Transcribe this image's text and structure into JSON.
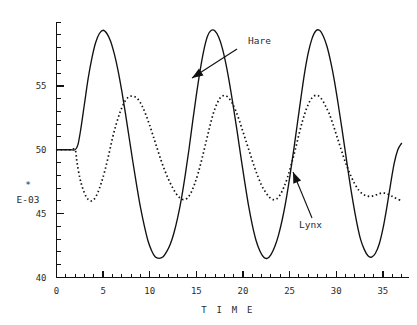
{
  "chart_data": {
    "type": "line",
    "title": "",
    "xlabel": "T I M E",
    "ylabel": "",
    "scale_note_marker": "*",
    "scale_note": "E-03",
    "xlim": [
      0,
      37.8
    ],
    "ylim": [
      40,
      60
    ],
    "grid": false,
    "legend_position": "inline-annotations",
    "x_ticks_major": [
      0,
      5,
      10,
      15,
      20,
      25,
      30,
      35
    ],
    "x_tick_labels": [
      "0",
      "5",
      "10",
      "15",
      "20",
      "25",
      "30",
      "35"
    ],
    "x_tick_minor_step": 1,
    "y_ticks_major": [
      40,
      45,
      50,
      55
    ],
    "y_tick_labels": [
      "40",
      "45",
      "50",
      "55"
    ],
    "y_tick_minor_step": 1,
    "annotations": [
      {
        "label": "Hare",
        "series": "Hare",
        "text_x": 248,
        "text_y": 44,
        "arrow_from_x": 237,
        "arrow_from_y": 49,
        "arrow_to_x": 192,
        "arrow_to_y": 78
      },
      {
        "label": "Lynx",
        "series": "Lynx",
        "text_x": 299,
        "text_y": 228,
        "arrow_from_x": 312,
        "arrow_from_y": 218,
        "arrow_to_x": 293,
        "arrow_to_y": 172
      }
    ],
    "series": [
      {
        "name": "Hare",
        "style": "solid",
        "x": [
          0,
          0.5,
          1,
          1.5,
          2,
          2.3,
          2.6,
          3,
          3.4,
          3.8,
          4.2,
          4.6,
          5,
          5.4,
          5.8,
          6.2,
          6.6,
          7,
          7.4,
          7.8,
          8.2,
          8.6,
          9,
          9.4,
          9.8,
          10.2,
          10.6,
          11,
          11.4,
          11.8,
          12.2,
          12.6,
          13,
          13.4,
          13.8,
          14.2,
          14.6,
          15,
          15.4,
          15.8,
          16.2,
          16.6,
          17,
          17.4,
          17.8,
          18.2,
          18.6,
          19,
          19.4,
          19.8,
          20.2,
          20.6,
          21,
          21.4,
          21.8,
          22.2,
          22.6,
          23,
          23.4,
          23.8,
          24.2,
          24.6,
          25,
          25.4,
          25.8,
          26.2,
          26.6,
          27,
          27.4,
          27.8,
          28.2,
          28.6,
          29,
          29.4,
          29.8,
          30.2,
          30.6,
          31,
          31.4,
          31.8,
          32.2,
          32.6,
          33,
          33.4,
          33.8,
          34.2,
          34.6,
          35,
          35.4,
          35.8,
          36.2,
          36.6,
          37
        ],
        "y": [
          50,
          50,
          50,
          50,
          50,
          50.4,
          51.6,
          53.6,
          55.6,
          57.2,
          58.4,
          59.1,
          59.35,
          59.1,
          58.5,
          57.5,
          56.2,
          54.6,
          52.8,
          50.9,
          49.0,
          47.2,
          45.5,
          44.1,
          42.9,
          42.1,
          41.6,
          41.5,
          41.6,
          42.0,
          42.6,
          43.5,
          44.7,
          46.2,
          48.0,
          50.0,
          52.2,
          54.3,
          56.2,
          57.8,
          58.9,
          59.35,
          59.3,
          58.8,
          57.9,
          56.6,
          55.0,
          53.2,
          51.3,
          49.3,
          47.4,
          45.6,
          44.1,
          42.9,
          42.1,
          41.6,
          41.5,
          41.8,
          42.4,
          43.3,
          44.5,
          46.0,
          47.8,
          49.8,
          51.9,
          54.0,
          56.0,
          57.6,
          58.7,
          59.3,
          59.35,
          58.9,
          58.1,
          56.9,
          55.4,
          53.6,
          51.7,
          49.7,
          47.7,
          45.9,
          44.3,
          43.0,
          42.2,
          41.7,
          41.6,
          41.9,
          42.6,
          43.8,
          45.4,
          47.2,
          48.9,
          50.0,
          50.5
        ]
      },
      {
        "name": "Lynx",
        "style": "dotted",
        "x": [
          0,
          0.5,
          1,
          1.5,
          2,
          2.2,
          2.5,
          2.8,
          3.2,
          3.6,
          4,
          4.4,
          4.8,
          5.2,
          5.6,
          6,
          6.4,
          6.8,
          7.2,
          7.6,
          8,
          8.4,
          8.8,
          9.2,
          9.6,
          10,
          10.4,
          10.8,
          11.2,
          11.6,
          12,
          12.4,
          12.8,
          13.2,
          13.6,
          14,
          14.4,
          14.8,
          15.2,
          15.6,
          16,
          16.4,
          16.8,
          17.2,
          17.6,
          18,
          18.4,
          18.8,
          19.2,
          19.6,
          20,
          20.4,
          20.8,
          21.2,
          21.6,
          22,
          22.4,
          22.8,
          23.2,
          23.6,
          24,
          24.4,
          24.8,
          25.2,
          25.6,
          26,
          26.4,
          26.8,
          27.2,
          27.6,
          28,
          28.4,
          28.8,
          29.2,
          29.6,
          30,
          30.4,
          30.8,
          31.2,
          31.6,
          32,
          32.4,
          32.8,
          33.2,
          33.6,
          34,
          34.4,
          34.8,
          35.2,
          35.6,
          36,
          36.4,
          37
        ],
        "y": [
          50,
          50,
          50,
          50,
          50,
          49.0,
          47.8,
          47.0,
          46.3,
          46.0,
          46.1,
          46.6,
          47.4,
          48.4,
          49.6,
          50.9,
          52.0,
          52.9,
          53.6,
          54.05,
          54.2,
          54.15,
          53.9,
          53.4,
          52.7,
          51.9,
          51.0,
          50.1,
          49.2,
          48.4,
          47.7,
          47.1,
          46.6,
          46.25,
          46.1,
          46.2,
          46.6,
          47.3,
          48.2,
          49.3,
          50.5,
          51.7,
          52.8,
          53.6,
          54.1,
          54.25,
          54.1,
          53.7,
          53.1,
          52.3,
          51.4,
          50.5,
          49.6,
          48.7,
          47.9,
          47.2,
          46.7,
          46.3,
          46.1,
          46.15,
          46.5,
          47.1,
          47.9,
          48.9,
          50.0,
          51.2,
          52.3,
          53.2,
          53.85,
          54.2,
          54.25,
          54.0,
          53.5,
          52.9,
          52.1,
          51.2,
          50.3,
          49.4,
          48.6,
          47.9,
          47.3,
          46.85,
          46.55,
          46.4,
          46.35,
          46.4,
          46.5,
          46.6,
          46.6,
          46.5,
          46.35,
          46.2,
          46.0
        ]
      }
    ]
  }
}
